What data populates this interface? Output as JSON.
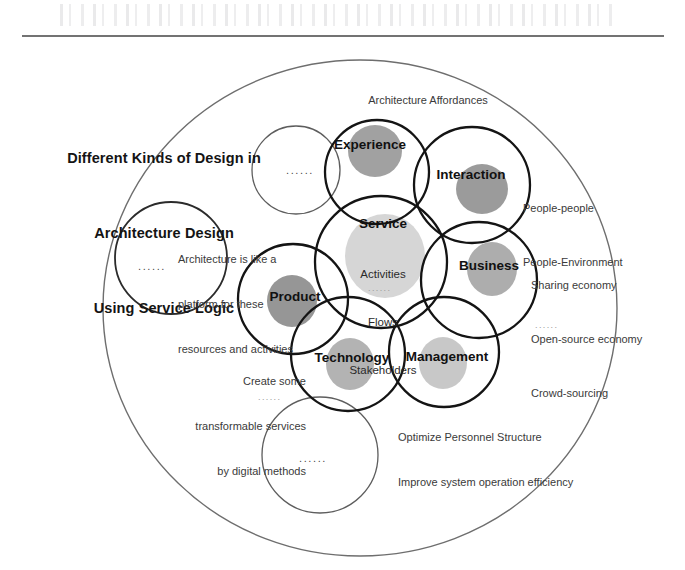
{
  "figure": {
    "title_lines": [
      "Different Kinds of Design in",
      "Architecture Design",
      "Using Service Logic"
    ],
    "title_full": "Different Kinds of Design in Architecture Design Using Service Logic",
    "core": {
      "label": "Service",
      "items": [
        "Activities",
        "Flows",
        "Stakeholders"
      ],
      "ellipsis": "......"
    },
    "domains": [
      {
        "id": "experience",
        "label": "Experience"
      },
      {
        "id": "interaction",
        "label": "Interaction"
      },
      {
        "id": "business",
        "label": "Business"
      },
      {
        "id": "product",
        "label": "Product"
      },
      {
        "id": "technology",
        "label": "Technology"
      },
      {
        "id": "management",
        "label": "Management"
      }
    ],
    "annotations": {
      "affordances": "Architecture Affordances",
      "interaction_lines": [
        "People-people",
        "People-Environment"
      ],
      "business_lines": [
        "Sharing economy",
        "Open-source economy",
        "Crowd-sourcing"
      ],
      "business_ellipsis": "......",
      "platform_lines": [
        "Architecture is like a",
        "platform for these",
        "resources and activities"
      ],
      "technology_lines": [
        "Create some",
        "transformable services",
        "by digital methods"
      ],
      "technology_ellipsis": "......",
      "management_lines": [
        "Optimize Personnel Structure",
        "Improve system operation efficiency"
      ],
      "management_ellipsis": "......"
    },
    "placeholder_circles": [
      {
        "id": "placeholder-top",
        "dots": "......"
      },
      {
        "id": "placeholder-left",
        "dots": "......"
      },
      {
        "id": "placeholder-bottom",
        "dots": "......"
      }
    ],
    "colors": {
      "stroke_strong": "#1c1c1c",
      "stroke_light": "#5a5a5a",
      "outer_ring": "#6e6e6e",
      "blob_dark": "#8f8f8f",
      "blob_mid": "#a8a8a8",
      "blob_light": "#c9c9c9",
      "text": "#2b2b2b",
      "background": "#ffffff"
    }
  }
}
